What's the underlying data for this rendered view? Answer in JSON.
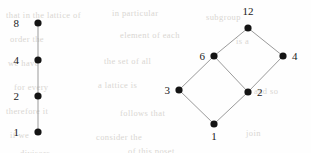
{
  "figure": {
    "background_color": "#fefefe",
    "node_color": "#141414",
    "edge_color": "#9a9a9a",
    "label_color": "#1a1a1a"
  },
  "bleed_text": [
    {
      "text": "that in the lattice of",
      "x": 6,
      "y": 10
    },
    {
      "text": "in particular",
      "x": 112,
      "y": 8
    },
    {
      "text": "subgroup",
      "x": 206,
      "y": 12
    },
    {
      "text": "order the",
      "x": 10,
      "y": 34
    },
    {
      "text": "element of each",
      "x": 120,
      "y": 30
    },
    {
      "text": "is a",
      "x": 236,
      "y": 36
    },
    {
      "text": "we have",
      "x": 8,
      "y": 58
    },
    {
      "text": "the set of all",
      "x": 104,
      "y": 56
    },
    {
      "text": "for every",
      "x": 14,
      "y": 82
    },
    {
      "text": "a lattice is",
      "x": 98,
      "y": 80
    },
    {
      "text": "and so",
      "x": 254,
      "y": 86
    },
    {
      "text": "therefore it",
      "x": 6,
      "y": 106
    },
    {
      "text": "follows that",
      "x": 120,
      "y": 108
    },
    {
      "text": "if we",
      "x": 10,
      "y": 130
    },
    {
      "text": "consider the",
      "x": 96,
      "y": 132
    },
    {
      "text": "join",
      "x": 246,
      "y": 128
    },
    {
      "text": "divisors",
      "x": 20,
      "y": 148
    },
    {
      "text": "of this poset",
      "x": 128,
      "y": 146
    }
  ],
  "chart_data": [
    {
      "type": "diagram",
      "name": "chain-lattice-of-8",
      "title": "Divisor lattice of 8 (chain)",
      "nodes": [
        {
          "id": "n8",
          "label": "8",
          "x": 38,
          "y": 23,
          "label_x": 19,
          "label_y": 27,
          "label_anchor": "end"
        },
        {
          "id": "n4",
          "label": "4",
          "x": 38,
          "y": 60,
          "label_x": 19,
          "label_y": 64,
          "label_anchor": "end"
        },
        {
          "id": "n2",
          "label": "2",
          "x": 38,
          "y": 96,
          "label_x": 19,
          "label_y": 100,
          "label_anchor": "end"
        },
        {
          "id": "n1",
          "label": "1",
          "x": 38,
          "y": 132,
          "label_x": 19,
          "label_y": 136,
          "label_anchor": "end"
        }
      ],
      "edges": [
        {
          "from": "n1",
          "to": "n2",
          "x1": 38,
          "y1": 132,
          "x2": 38,
          "y2": 96
        },
        {
          "from": "n2",
          "to": "n4",
          "x1": 38,
          "y1": 96,
          "x2": 38,
          "y2": 60
        },
        {
          "from": "n4",
          "to": "n8",
          "x1": 38,
          "y1": 60,
          "x2": 38,
          "y2": 23
        }
      ]
    },
    {
      "type": "diagram",
      "name": "divisor-lattice-of-12",
      "title": "Divisor lattice of 12",
      "nodes": [
        {
          "id": "d12",
          "label": "12",
          "x": 248,
          "y": 28,
          "label_x": 248,
          "label_y": 15,
          "label_anchor": "middle"
        },
        {
          "id": "d6",
          "label": "6",
          "x": 214,
          "y": 56,
          "label_x": 205,
          "label_y": 60,
          "label_anchor": "end"
        },
        {
          "id": "d4",
          "label": "4",
          "x": 283,
          "y": 56,
          "label_x": 292,
          "label_y": 60,
          "label_anchor": "start"
        },
        {
          "id": "d3",
          "label": "3",
          "x": 179,
          "y": 90,
          "label_x": 170,
          "label_y": 94,
          "label_anchor": "end"
        },
        {
          "id": "d2",
          "label": "2",
          "x": 248,
          "y": 92,
          "label_x": 257,
          "label_y": 96,
          "label_anchor": "start"
        },
        {
          "id": "d1",
          "label": "1",
          "x": 214,
          "y": 124,
          "label_x": 214,
          "label_y": 140,
          "label_anchor": "middle"
        }
      ],
      "edges": [
        {
          "from": "d1",
          "to": "d3",
          "x1": 214,
          "y1": 124,
          "x2": 179,
          "y2": 90
        },
        {
          "from": "d1",
          "to": "d2",
          "x1": 214,
          "y1": 124,
          "x2": 248,
          "y2": 92
        },
        {
          "from": "d3",
          "to": "d6",
          "x1": 179,
          "y1": 90,
          "x2": 214,
          "y2": 56
        },
        {
          "from": "d2",
          "to": "d6",
          "x1": 248,
          "y1": 92,
          "x2": 214,
          "y2": 56
        },
        {
          "from": "d2",
          "to": "d4",
          "x1": 248,
          "y1": 92,
          "x2": 283,
          "y2": 56
        },
        {
          "from": "d6",
          "to": "d12",
          "x1": 214,
          "y1": 56,
          "x2": 248,
          "y2": 28
        },
        {
          "from": "d4",
          "to": "d12",
          "x1": 283,
          "y1": 56,
          "x2": 248,
          "y2": 28
        }
      ]
    }
  ]
}
